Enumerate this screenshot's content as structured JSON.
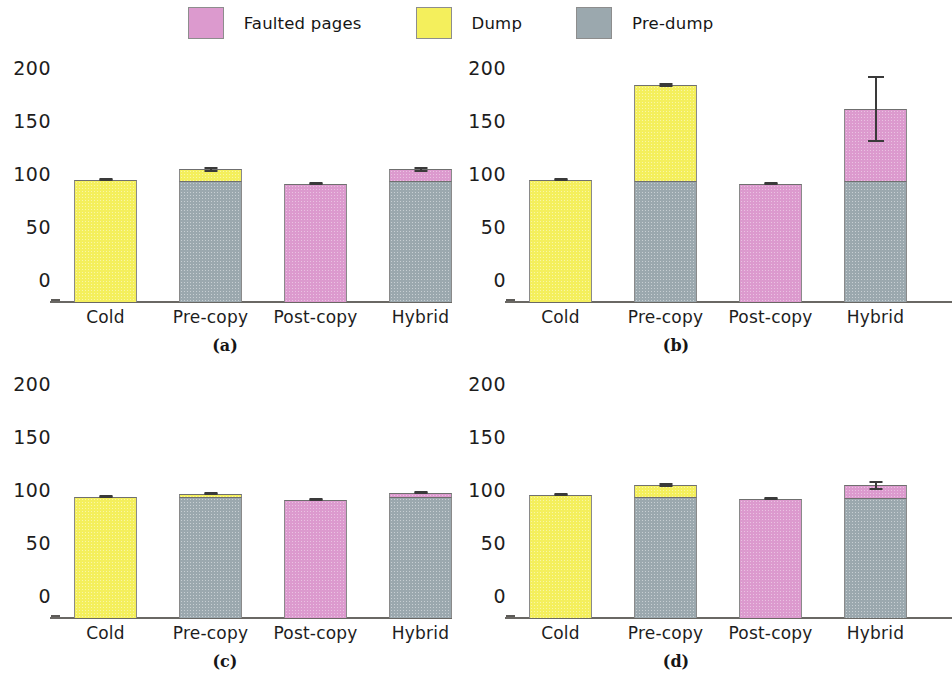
{
  "legend": {
    "items": [
      {
        "label": "Faulted pages",
        "color": "#dc9ace",
        "key": "faulted"
      },
      {
        "label": "Dump",
        "color": "#f4ef5c",
        "key": "dump"
      },
      {
        "label": "Pre-dump",
        "color": "#9ba8ae",
        "key": "predump"
      }
    ]
  },
  "axis": {
    "yticks": [
      "200",
      "150",
      "100",
      "50",
      "0"
    ],
    "ytick_values": [
      200,
      150,
      100,
      50,
      0
    ],
    "ymin": 0,
    "ymax": 215,
    "categories": [
      "Cold",
      "Pre-copy",
      "Post-copy",
      "Hybrid"
    ]
  },
  "captions": {
    "a": "(a)",
    "b": "(b)",
    "c": "(c)",
    "d": "(d)"
  },
  "chart_data": [
    {
      "type": "bar",
      "title": "(a)",
      "stacked": true,
      "categories": [
        "Cold",
        "Pre-copy",
        "Post-copy",
        "Hybrid"
      ],
      "series": [
        {
          "name": "Pre-dump",
          "color": "#9ba8ae",
          "values": [
            0,
            114,
            0,
            114
          ]
        },
        {
          "name": "Dump",
          "color": "#f4ef5c",
          "values": [
            115,
            11,
            0,
            0
          ]
        },
        {
          "name": "Faulted pages",
          "color": "#dc9ace",
          "values": [
            0,
            0,
            111,
            11
          ]
        }
      ],
      "totals": [
        115,
        125,
        111,
        125
      ],
      "errors": [
        {
          "category": "Cold",
          "low": 114,
          "high": 116
        },
        {
          "category": "Pre-copy",
          "low": 123,
          "high": 127
        },
        {
          "category": "Post-copy",
          "low": 110,
          "high": 112
        },
        {
          "category": "Hybrid",
          "low": 123,
          "high": 127
        }
      ],
      "xlabel": "",
      "ylabel": "",
      "ylim": [
        0,
        215
      ],
      "grid": false,
      "legend_position": "top"
    },
    {
      "type": "bar",
      "title": "(b)",
      "stacked": true,
      "categories": [
        "Cold",
        "Pre-copy",
        "Post-copy",
        "Hybrid"
      ],
      "series": [
        {
          "name": "Pre-dump",
          "color": "#9ba8ae",
          "values": [
            0,
            114,
            0,
            114
          ]
        },
        {
          "name": "Dump",
          "color": "#f4ef5c",
          "values": [
            115,
            91,
            0,
            0
          ]
        },
        {
          "name": "Faulted pages",
          "color": "#dc9ace",
          "values": [
            0,
            0,
            111,
            68
          ]
        }
      ],
      "totals": [
        115,
        205,
        111,
        182
      ],
      "errors": [
        {
          "category": "Cold",
          "low": 114,
          "high": 117
        },
        {
          "category": "Pre-copy",
          "low": 203,
          "high": 207
        },
        {
          "category": "Post-copy",
          "low": 110,
          "high": 113
        },
        {
          "category": "Hybrid",
          "low": 151,
          "high": 213
        }
      ],
      "xlabel": "",
      "ylabel": "",
      "ylim": [
        0,
        215
      ],
      "grid": false,
      "legend_position": "top"
    },
    {
      "type": "bar",
      "title": "(c)",
      "stacked": true,
      "categories": [
        "Cold",
        "Pre-copy",
        "Post-copy",
        "Hybrid"
      ],
      "series": [
        {
          "name": "Pre-dump",
          "color": "#9ba8ae",
          "values": [
            0,
            114,
            0,
            114
          ]
        },
        {
          "name": "Dump",
          "color": "#f4ef5c",
          "values": [
            114,
            3,
            0,
            0
          ]
        },
        {
          "name": "Faulted pages",
          "color": "#dc9ace",
          "values": [
            0,
            0,
            111,
            4
          ]
        }
      ],
      "totals": [
        114,
        117,
        111,
        118
      ],
      "errors": [
        {
          "category": "Cold",
          "low": 113,
          "high": 115
        },
        {
          "category": "Pre-copy",
          "low": 116,
          "high": 119
        },
        {
          "category": "Post-copy",
          "low": 110,
          "high": 112
        },
        {
          "category": "Hybrid",
          "low": 117,
          "high": 120
        }
      ],
      "xlabel": "",
      "ylabel": "",
      "ylim": [
        0,
        215
      ],
      "grid": false,
      "legend_position": "top"
    },
    {
      "type": "bar",
      "title": "(d)",
      "stacked": true,
      "categories": [
        "Cold",
        "Pre-copy",
        "Post-copy",
        "Hybrid"
      ],
      "series": [
        {
          "name": "Pre-dump",
          "color": "#9ba8ae",
          "values": [
            0,
            114,
            0,
            113
          ]
        },
        {
          "name": "Dump",
          "color": "#f4ef5c",
          "values": [
            116,
            11,
            0,
            0
          ]
        },
        {
          "name": "Faulted pages",
          "color": "#dc9ace",
          "values": [
            0,
            0,
            112,
            12
          ]
        }
      ],
      "totals": [
        116,
        125,
        112,
        125
      ],
      "errors": [
        {
          "category": "Cold",
          "low": 115,
          "high": 117
        },
        {
          "category": "Pre-copy",
          "low": 124,
          "high": 127
        },
        {
          "category": "Post-copy",
          "low": 111,
          "high": 113
        },
        {
          "category": "Hybrid",
          "low": 121,
          "high": 129
        }
      ],
      "xlabel": "",
      "ylabel": "",
      "ylim": [
        0,
        215
      ],
      "grid": false,
      "legend_position": "top"
    }
  ]
}
